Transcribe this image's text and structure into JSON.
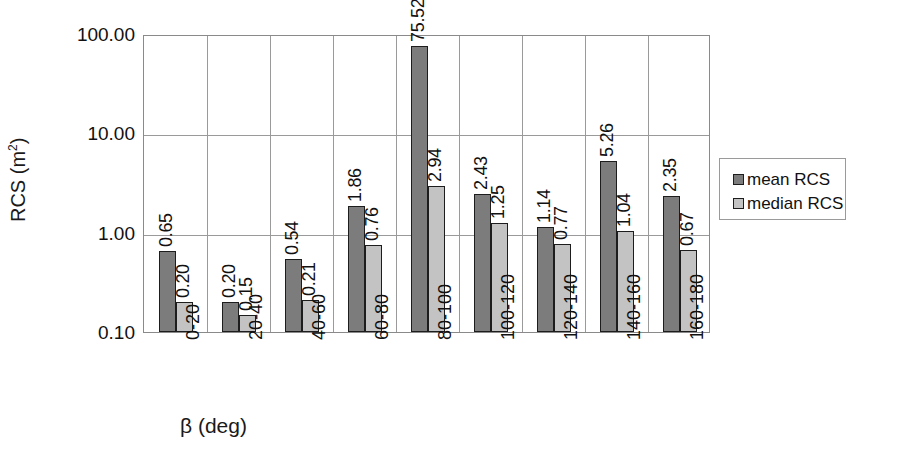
{
  "chart_data": {
    "type": "bar",
    "title": "",
    "xlabel": "β (deg)",
    "ylabel": "RCS (m²)",
    "yscale": "log",
    "ylim": [
      0.1,
      100.0
    ],
    "ytick_labels": [
      "100.00",
      "10.00",
      "1.00",
      "0.10"
    ],
    "ytick_values": [
      100.0,
      10.0,
      1.0,
      0.1
    ],
    "grid": "horizontal-and-vertical",
    "legend_position": "right",
    "categories": [
      "0-20",
      "20-40",
      "40-60",
      "60-80",
      "80-100",
      "100-120",
      "120-140",
      "140-160",
      "160-180"
    ],
    "series": [
      {
        "name": "mean RCS",
        "color": "#7c7c7c",
        "values": [
          0.65,
          0.2,
          0.54,
          1.86,
          75.52,
          2.43,
          1.14,
          5.26,
          2.35
        ],
        "labels": [
          "0.65",
          "0.20",
          "0.54",
          "1.86",
          "75.52",
          "2.43",
          "1.14",
          "5.26",
          "2.35"
        ]
      },
      {
        "name": "median RCS",
        "color": "#c3c3c3",
        "values": [
          0.2,
          0.15,
          0.21,
          0.76,
          2.94,
          1.25,
          0.77,
          1.04,
          0.67
        ],
        "labels": [
          "0.20",
          "0.15",
          "0.21",
          "0.76",
          "2.94",
          "1.25",
          "0.77",
          "1.04",
          "0.67"
        ]
      }
    ]
  },
  "legend": {
    "items": [
      {
        "label": "mean RCS"
      },
      {
        "label": "median RCS"
      }
    ]
  },
  "axes": {
    "y_title_main": "RCS (m",
    "y_title_sup": "2",
    "y_title_tail": ")",
    "x_title": "β (deg)"
  }
}
